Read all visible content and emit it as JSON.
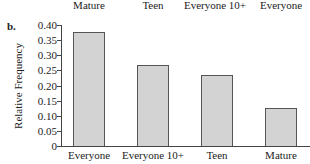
{
  "previous_chart_tail": {
    "labels": [
      "Mature",
      "Teen",
      "Everyone 10+",
      "Everyone"
    ]
  },
  "part_label": "b.",
  "chart_data": {
    "type": "bar",
    "title": "",
    "xlabel": "",
    "ylabel": "Relative Frequency",
    "categories": [
      "Everyone",
      "Everyone 10+",
      "Teen",
      "Mature"
    ],
    "values": [
      0.377,
      0.268,
      0.235,
      0.126
    ],
    "ylim": [
      0,
      0.4
    ],
    "yticks": [
      "0",
      "0.05",
      "0.10",
      "0.15",
      "0.20",
      "0.25",
      "0.30",
      "0.35",
      "0.40"
    ],
    "grid": false,
    "legend": null,
    "bar_color": "#d3d3d3",
    "bar_edge_color": "#555555"
  }
}
